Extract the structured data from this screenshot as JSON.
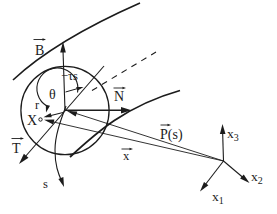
{
  "diagram": {
    "title_semantic": "Frenet frame diagram of a space curve with cross-section circle and lab axes",
    "background": "#ffffff",
    "ink": "#1c1c1c",
    "frame_labels": {
      "binormal": "B",
      "normal": "N",
      "tangent": "T"
    },
    "angle_labels": {
      "theta": "θ",
      "torsion_offset": "−τs"
    },
    "geometry_labels": {
      "radius": "r",
      "material_point": "X",
      "arc_length": "s"
    },
    "vector_labels": {
      "centerline_position": "P(s)",
      "point_position": "x"
    },
    "axes": {
      "x1": {
        "base": "x",
        "sub": "1"
      },
      "x2": {
        "base": "x",
        "sub": "2"
      },
      "x3": {
        "base": "x",
        "sub": "3"
      }
    }
  }
}
